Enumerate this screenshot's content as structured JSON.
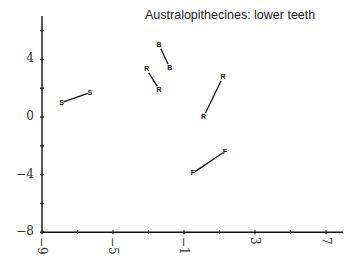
{
  "chart_data": {
    "type": "scatter",
    "title": "Australopithecines: lower teeth",
    "xlabel": "",
    "ylabel": "",
    "xlim": [
      -9,
      8
    ],
    "ylim": [
      -8,
      6
    ],
    "x_ticks": [
      -9,
      -7,
      -5,
      -3,
      -1,
      1,
      3,
      5,
      7
    ],
    "x_tick_labels": [
      "−9",
      "−5",
      "−1",
      "3",
      "7"
    ],
    "x_tick_label_values": [
      -9,
      -5,
      -1,
      3,
      7
    ],
    "y_ticks": [
      -8,
      -6,
      -4,
      -2,
      0,
      2,
      4,
      6
    ],
    "y_tick_labels": [
      "4",
      "0",
      "−4",
      "−8"
    ],
    "y_tick_label_values": [
      4,
      0,
      -4,
      -8
    ],
    "grid": false,
    "legend": null,
    "series": [
      {
        "name": "S",
        "label": "S",
        "points": [
          [
            -7.9,
            1.0
          ],
          [
            -6.3,
            1.7
          ]
        ]
      },
      {
        "name": "B",
        "label": "B",
        "points": [
          [
            -2.4,
            5.0
          ],
          [
            -1.8,
            3.4
          ]
        ]
      },
      {
        "name": "R (pair 1)",
        "label": "R",
        "points": [
          [
            -3.1,
            3.3
          ],
          [
            -2.4,
            1.9
          ]
        ]
      },
      {
        "name": "R (pair 2)",
        "label": "R",
        "points": [
          [
            1.2,
            2.8
          ],
          [
            0.1,
            0.0
          ]
        ]
      },
      {
        "name": "F",
        "label": "F",
        "points": [
          [
            1.3,
            -2.4
          ],
          [
            -0.5,
            -3.9
          ]
        ]
      }
    ]
  }
}
